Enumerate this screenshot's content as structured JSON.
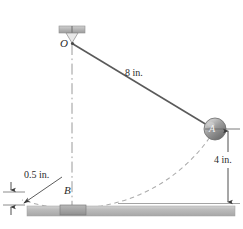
{
  "figure": {
    "type": "engineering-mechanics-pendulum-diagram",
    "background_color": "#ffffff",
    "line_color": "#555555",
    "ink_color": "#2b2b2b",
    "ground_color": "#b3b3b3",
    "ball_color": "#8a8a8a",
    "dash_color": "#a8a8a8"
  },
  "labels": {
    "pivot": "O",
    "ball": "A",
    "bottom_point": "B"
  },
  "dimensions": {
    "rod_length": "8 in.",
    "ball_height": "4 in.",
    "ground_clearance": "0.5 in."
  },
  "caption": "Prob. 13/1",
  "geometry": {
    "pivot_px": [
      72,
      42
    ],
    "ball_px": [
      215,
      129
    ],
    "bottom_px": [
      72,
      200
    ],
    "rod_label_px": [
      125,
      68
    ],
    "ground_y_px": 206,
    "ground_thickness_px": 10
  },
  "elements": {
    "ceiling_bracket": "ceiling-mount-bracket",
    "rod": "pendulum-rod",
    "ball": "pendulum-ball",
    "arc": "swing-path-arc",
    "centerline": "vertical-center-line",
    "ground": "ground-surface",
    "base_block": "base-block-at-B",
    "dim_line_4in": "vertical-dimension-4in",
    "leader_05in": "leader-line-0.5in",
    "dim_arrows_05in": "dimension-arrows-0.5in"
  }
}
